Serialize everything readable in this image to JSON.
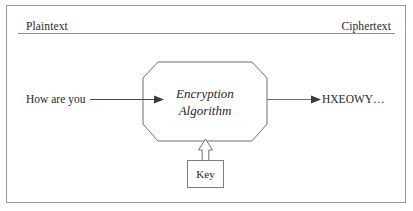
{
  "figure": {
    "background_color": "#ffffff",
    "border_color": "#9a9a9a",
    "line_color": "#6f6f6f",
    "text_color": "#262626"
  },
  "channels": {
    "left_label": "Plaintext",
    "right_label": "Ciphertext"
  },
  "flow": {
    "input_text": "How are you",
    "output_text": "HXEOWY…",
    "process_line_1": "Encryption",
    "process_line_2": "Algorithm",
    "key_label": "Key"
  },
  "icons": {
    "input_arrow": "arrow-right-icon",
    "output_arrow": "arrow-right-icon",
    "key_arrow": "block-arrow-up-icon"
  }
}
